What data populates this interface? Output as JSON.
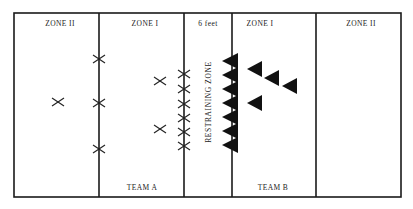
{
  "diagram": {
    "zones": [
      {
        "id": "team-a-zone-2",
        "label": "ZONE II"
      },
      {
        "id": "team-a-zone-1",
        "label": "ZONE I"
      },
      {
        "id": "restraining",
        "label": "6 feet",
        "vertical_label": "RESTRAINING ZONE"
      },
      {
        "id": "team-b-zone-1",
        "label": "ZONE I"
      },
      {
        "id": "team-b-zone-2",
        "label": "ZONE II"
      }
    ],
    "teams": [
      {
        "id": "team-a",
        "label": "TEAM A",
        "marker": "x-mark",
        "player_count": 12
      },
      {
        "id": "team-b",
        "label": "TEAM B",
        "marker": "triangle",
        "player_count": 11
      }
    ],
    "colors": {
      "line": "#1a1a1a",
      "marker": "#111111",
      "background": "#ffffff"
    }
  }
}
